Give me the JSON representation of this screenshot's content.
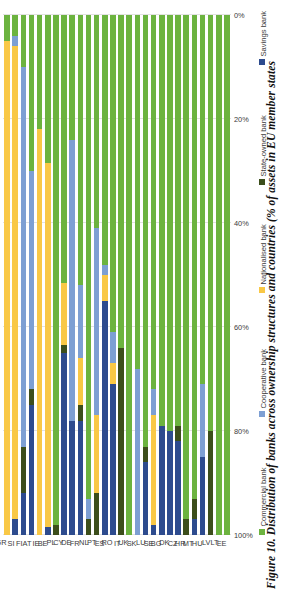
{
  "figure": {
    "title": "Figure 10. Distribution of banks across ownership structures and countries (% of assets in EU member states"
  },
  "axis": {
    "ticks": [
      "100%",
      "80%",
      "60%",
      "40%",
      "20%",
      "0%"
    ],
    "tick_values": [
      100,
      80,
      60,
      40,
      20,
      0
    ]
  },
  "legend": {
    "items": [
      {
        "label": "Commercial bank",
        "color": "#6cb33f"
      },
      {
        "label": "Cooperative bank",
        "color": "#7d9fd3"
      },
      {
        "label": "Nationalised bank",
        "color": "#f9c846"
      },
      {
        "label": "State-owned bank",
        "color": "#3c4e1b"
      },
      {
        "label": "Savings bank",
        "color": "#2d4b8e"
      }
    ]
  },
  "chart_data": {
    "type": "bar",
    "title": "Figure 10. Distribution of banks across ownership structures and countries (% of assets in EU member states",
    "orientation": "horizontal-stacked",
    "stacked": true,
    "xlabel": "",
    "ylabel": "",
    "xlim": [
      0,
      100
    ],
    "axis_direction": "100% at left, 0% at right",
    "grid": true,
    "legend_position": "bottom",
    "categories": [
      "GR",
      "SI",
      "FI",
      "AT",
      "IE",
      "BE",
      "PL",
      "CY",
      "DE",
      "FR",
      "NL",
      "PT",
      "ES",
      "RO",
      "IT",
      "UK",
      "SK",
      "LU",
      "SE",
      "BG",
      "DK",
      "CZ",
      "HR",
      "MT",
      "HU",
      "LV",
      "LT",
      "EE"
    ],
    "series": [
      {
        "name": "Savings bank",
        "color": "#2d4b8e",
        "values": [
          0,
          3,
          8,
          25,
          0,
          1.5,
          0,
          35,
          22,
          22,
          0,
          0,
          45,
          29,
          0,
          0,
          0,
          14,
          2,
          21,
          20,
          18,
          0,
          3,
          15,
          0,
          0,
          0
        ]
      },
      {
        "name": "State-owned bank",
        "color": "#3c4e1b",
        "values": [
          0,
          0,
          9,
          3,
          0,
          0,
          2,
          1.5,
          0,
          3,
          3,
          8,
          0,
          0,
          36,
          0,
          0,
          3,
          0,
          0,
          0,
          3,
          3,
          4,
          0,
          20,
          0,
          0
        ]
      },
      {
        "name": "Nationalised bank",
        "color": "#f9c846",
        "values": [
          95,
          91,
          0,
          0,
          78,
          70,
          0,
          12,
          0,
          9,
          0,
          15,
          5,
          4,
          0,
          0,
          0,
          0,
          21,
          0,
          0,
          0,
          0,
          0,
          0,
          0,
          0,
          0
        ]
      },
      {
        "name": "Cooperative bank",
        "color": "#7d9fd3",
        "values": [
          0,
          2,
          73,
          42,
          0,
          0,
          0,
          0,
          54,
          14,
          4,
          36,
          2,
          6,
          0,
          0,
          32,
          0,
          5,
          0,
          0,
          0,
          0,
          0,
          14,
          0,
          0,
          0
        ]
      },
      {
        "name": "Commercial bank",
        "color": "#6cb33f",
        "values": [
          5,
          4,
          10,
          30,
          22,
          28.5,
          98,
          51.5,
          24,
          52,
          93,
          41,
          48,
          61,
          64,
          100,
          68,
          83,
          72,
          79,
          80,
          79,
          97,
          93,
          71,
          80,
          100,
          100
        ]
      }
    ]
  }
}
